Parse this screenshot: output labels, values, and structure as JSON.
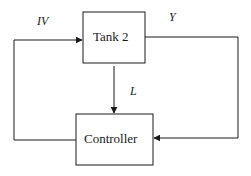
{
  "diagram": {
    "blocks": {
      "tank": {
        "label": "Tank 2"
      },
      "controller": {
        "label": "Controller"
      }
    },
    "signals": {
      "input": {
        "label": "IV"
      },
      "output": {
        "label": "Y"
      },
      "disturbance": {
        "label": "L"
      }
    },
    "colors": {
      "stroke": "#1a1a1a",
      "background": "#ffffff"
    }
  }
}
